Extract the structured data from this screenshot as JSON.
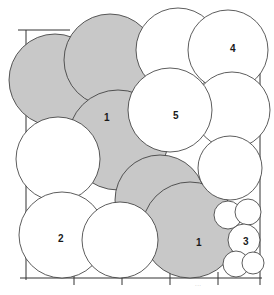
{
  "diagram": {
    "colors": {
      "shade": "#c8c8c8",
      "stroke": "#333333",
      "background": "#ffffff"
    },
    "labels": {
      "zone_1_upper": "1",
      "zone_1_lower": "1",
      "zone_2": "2",
      "zone_3": "3",
      "zone_4": "4",
      "zone_5": "5"
    },
    "caption": "..."
  }
}
